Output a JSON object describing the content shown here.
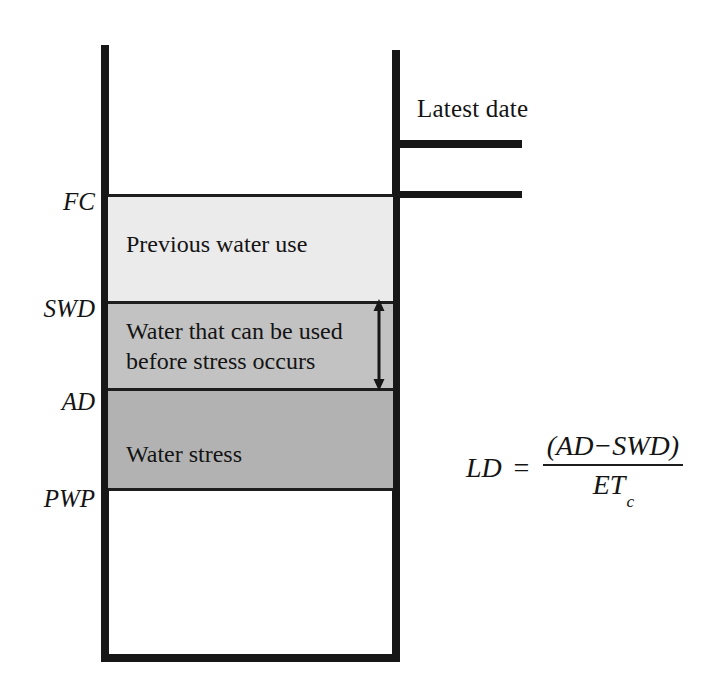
{
  "figure": {
    "latest_date_label": "Latest date"
  },
  "axis_labels": [
    {
      "id": "FC",
      "text": "FC",
      "meaning": "Field capacity",
      "y": 195
    },
    {
      "id": "SWD",
      "text": "SWD",
      "meaning": "Soil water deficit",
      "y": 301
    },
    {
      "id": "AD",
      "text": "AD",
      "meaning": "Allowable depletion",
      "y": 388
    },
    {
      "id": "PWP",
      "text": "PWP",
      "meaning": "Permanent wilting point",
      "y": 491
    }
  ],
  "bands": [
    {
      "id": "previous-water-use",
      "label": "Previous water use",
      "top_boundary": "FC",
      "bottom_boundary": "SWD",
      "fill": "#ebebeb"
    },
    {
      "id": "usable-water",
      "label_line_1": "Water that can be used",
      "label_line_2": "before stress occurs",
      "top_boundary": "SWD",
      "bottom_boundary": "AD",
      "fill": "#c2c2c2",
      "annotated_by": "double-headed vertical arrow"
    },
    {
      "id": "water-stress",
      "label": "Water stress",
      "top_boundary": "AD",
      "bottom_boundary": "PWP",
      "fill": "#b2b2b2"
    }
  ],
  "equation": {
    "lhs": "LD",
    "operator": "=",
    "numerator": "(AD−SWD)",
    "denominator_base": "ET",
    "denominator_subscript": "c",
    "plain": "LD = (AD−SWD) / ETc"
  },
  "colors": {
    "stroke": "#171717",
    "band_light": "#ebebeb",
    "band_medium": "#c2c2c2",
    "band_dark": "#b2b2b2",
    "background": "#ffffff"
  }
}
